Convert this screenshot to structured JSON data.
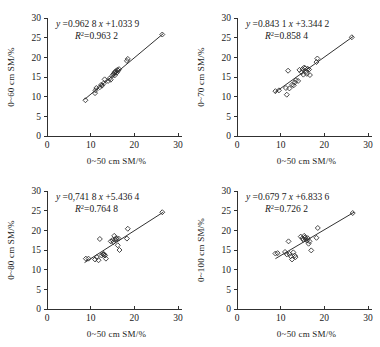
{
  "figure": {
    "axis_x_title": "0~50 cm  SM/%",
    "x_ticks": [
      "0",
      "10",
      "20",
      "30"
    ],
    "y_ticks": [
      "0",
      "5",
      "10",
      "15",
      "20",
      "25",
      "30"
    ]
  },
  "chart_data": [
    {
      "type": "scatter",
      "panel": "a",
      "title": "",
      "xlabel": "0~50 cm  SM/%",
      "ylabel": "0~60 cm  SM/%",
      "xlim": [
        0,
        30
      ],
      "ylim": [
        0,
        30
      ],
      "xticks": [
        0,
        10,
        20,
        30
      ],
      "yticks": [
        0,
        5,
        10,
        15,
        20,
        25,
        30
      ],
      "grid": false,
      "legend": "none",
      "equation": "y =0.962  8 x +1.033  9",
      "equation_slope": 0.9628,
      "equation_intercept": 1.0339,
      "r2_label": "R  =0.963  2",
      "r2": 0.9632,
      "marker": "open-diamond",
      "fit_line": {
        "x0": 8.6,
        "y0": 9.3,
        "x1": 26.6,
        "y1": 26.0
      },
      "x": [
        8.8,
        11.0,
        11.1,
        11.3,
        12.1,
        12.4,
        12.6,
        13.0,
        13.2,
        14.0,
        14.3,
        14.6,
        15.0,
        15.2,
        15.4,
        15.5,
        15.6,
        15.8,
        16.0,
        16.1,
        16.3,
        16.5,
        18.3,
        18.5,
        26.4
      ],
      "y": [
        9.1,
        10.9,
        11.6,
        12.2,
        12.4,
        13.0,
        12.8,
        13.4,
        14.4,
        14.0,
        14.6,
        14.3,
        15.4,
        15.7,
        16.0,
        15.4,
        16.3,
        16.5,
        16.1,
        16.8,
        16.6,
        17.0,
        19.1,
        19.6,
        25.8
      ]
    },
    {
      "type": "scatter",
      "panel": "b",
      "title": "",
      "xlabel": "0~50 cm  SM/%",
      "ylabel": "0~70 cm  SM/%",
      "xlim": [
        0,
        30
      ],
      "ylim": [
        0,
        30
      ],
      "xticks": [
        0,
        10,
        20,
        30
      ],
      "yticks": [
        0,
        5,
        10,
        15,
        20,
        25,
        30
      ],
      "grid": false,
      "legend": "none",
      "equation": "y =0.843  1 x +3.344  2",
      "equation_slope": 0.8431,
      "equation_intercept": 3.3442,
      "r2_label": "R  =0.858  4",
      "r2": 0.8584,
      "marker": "open-diamond",
      "fit_line": {
        "x0": 8.6,
        "y0": 11.0,
        "x1": 26.6,
        "y1": 25.3
      },
      "x": [
        8.8,
        9.6,
        11.2,
        11.4,
        11.7,
        12.0,
        12.6,
        13.0,
        13.2,
        13.5,
        14.0,
        14.3,
        14.8,
        15.0,
        15.2,
        15.4,
        15.6,
        15.8,
        16.0,
        16.2,
        16.5,
        16.7,
        18.2,
        18.4,
        26.3
      ],
      "y": [
        11.4,
        11.6,
        12.2,
        10.5,
        16.6,
        12.1,
        13.0,
        12.9,
        13.6,
        14.2,
        14.0,
        16.8,
        16.2,
        17.0,
        15.6,
        17.4,
        17.2,
        16.3,
        15.8,
        17.1,
        16.9,
        15.5,
        18.8,
        19.7,
        25.1
      ]
    },
    {
      "type": "scatter",
      "panel": "c",
      "title": "",
      "xlabel": "0~50 cm  SM/%",
      "ylabel": "0~80 cm  SM/%",
      "xlim": [
        0,
        30
      ],
      "ylim": [
        0,
        30
      ],
      "xticks": [
        0,
        10,
        20,
        30
      ],
      "yticks": [
        0,
        5,
        10,
        15,
        20,
        25,
        30
      ],
      "grid": false,
      "legend": "none",
      "equation": "y =0,741  8 x +5.436  4",
      "equation_slope": 0.7418,
      "equation_intercept": 5.4364,
      "r2_label": "R  =0.764  8",
      "r2": 0.7648,
      "marker": "open-diamond",
      "fit_line": {
        "x0": 8.6,
        "y0": 11.8,
        "x1": 26.6,
        "y1": 24.6
      },
      "x": [
        8.9,
        9.5,
        11.0,
        11.4,
        11.8,
        12.1,
        12.5,
        12.8,
        13.0,
        13.1,
        13.3,
        13.5,
        14.6,
        15.0,
        15.2,
        15.4,
        15.6,
        15.8,
        16.0,
        16.2,
        16.4,
        16.6,
        18.3,
        18.5,
        26.4
      ],
      "y": [
        12.8,
        12.8,
        12.6,
        13.2,
        12.4,
        17.8,
        13.6,
        13.9,
        14.0,
        13.8,
        13.6,
        12.8,
        17.2,
        17.5,
        17.0,
        18.6,
        17.6,
        18.0,
        17.8,
        16.2,
        17.9,
        15.0,
        17.9,
        20.4,
        24.6
      ]
    },
    {
      "type": "scatter",
      "panel": "d",
      "title": "",
      "xlabel": "0~50 cm  SM/%",
      "ylabel": "0~100 cm  SM/%",
      "xlim": [
        0,
        30
      ],
      "ylim": [
        0,
        30
      ],
      "xticks": [
        0,
        10,
        20,
        30
      ],
      "yticks": [
        0,
        5,
        10,
        15,
        20,
        25,
        30
      ],
      "grid": false,
      "legend": "none",
      "equation": "y =0.679  7 x +6.833  6",
      "equation_slope": 0.6797,
      "equation_intercept": 6.8336,
      "r2_label": "R  =0.726  2",
      "r2": 0.7262,
      "marker": "open-diamond",
      "fit_line": {
        "x0": 8.8,
        "y0": 12.8,
        "x1": 26.8,
        "y1": 24.6
      },
      "x": [
        8.8,
        9.3,
        11.0,
        11.4,
        11.8,
        12.0,
        12.3,
        12.6,
        12.9,
        13.2,
        13.4,
        14.6,
        15.0,
        15.2,
        15.4,
        15.6,
        15.8,
        16.0,
        16.2,
        16.4,
        16.6,
        17.0,
        18.2,
        18.5,
        26.5
      ],
      "y": [
        14.1,
        14.2,
        14.5,
        13.9,
        17.2,
        14.0,
        13.4,
        12.6,
        14.4,
        13.6,
        13.2,
        18.4,
        18.0,
        17.6,
        18.6,
        18.2,
        17.8,
        17.4,
        18.0,
        16.6,
        17.2,
        14.9,
        18.1,
        20.6,
        24.4
      ]
    }
  ]
}
